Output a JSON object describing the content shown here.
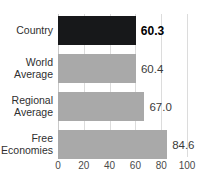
{
  "chart_data": {
    "type": "bar",
    "orientation": "horizontal",
    "title": "",
    "title_clipped": true,
    "xlabel": "",
    "ylabel": "",
    "xlim": [
      0,
      100
    ],
    "grid": true,
    "grid_axis": "x",
    "legend": false,
    "categories": [
      "Country",
      "World Average",
      "Regional Average",
      "Free Economies"
    ],
    "values": [
      60.3,
      60.4,
      67.0,
      84.6
    ],
    "value_labels": [
      "60.3",
      "60.4",
      "67.0",
      "84.6"
    ],
    "xticks": [
      0,
      20,
      40,
      60,
      80,
      100
    ],
    "xtick_labels": [
      "0",
      "20",
      "40",
      "60",
      "80",
      "100"
    ],
    "bars": [
      {
        "category": "Country",
        "label_line1": "Country",
        "label_line2": "",
        "value": 60.3,
        "value_label": "60.3",
        "color": "#17181a",
        "highlight": true
      },
      {
        "category": "World Average",
        "label_line1": "World",
        "label_line2": "Average",
        "value": 60.4,
        "value_label": "60.4",
        "color": "#a9a9a9",
        "highlight": false
      },
      {
        "category": "Regional Average",
        "label_line1": "Regional",
        "label_line2": "Average",
        "value": 67.0,
        "value_label": "67.0",
        "color": "#a9a9a9",
        "highlight": false
      },
      {
        "category": "Free Economies",
        "label_line1": "Free",
        "label_line2": "Economies",
        "value": 84.6,
        "value_label": "84.6",
        "color": "#a9a9a9",
        "highlight": false
      }
    ],
    "colors": {
      "highlight_bar": "#17181a",
      "default_bar": "#a9a9a9",
      "gridline": "#dcdcdc",
      "axis_text": "#4a4a4a",
      "category_text": "#2f2f2f",
      "background": "#ffffff"
    }
  }
}
